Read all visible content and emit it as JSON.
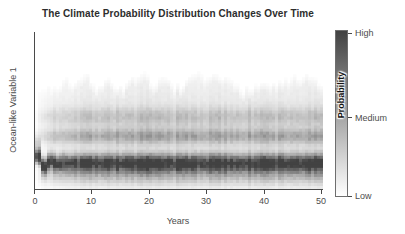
{
  "title": "The Climate Probability Distribution Changes Over Time",
  "axes": {
    "x_label": "Years",
    "y_label": "Ocean-like Variable 1",
    "x_tick_labels": [
      "0",
      "10",
      "20",
      "30",
      "40",
      "50"
    ]
  },
  "colorbar": {
    "label": "Probability",
    "ticks": [
      "High",
      "Medium",
      "Low"
    ]
  },
  "colors": {
    "background": "#ffffff",
    "title_text": "#2d2d2d",
    "label_text": "#4d4d4d",
    "spine": "#4a4a4a",
    "colorbar_border": "#6e6e6e"
  },
  "chart_data": {
    "type": "heatmap",
    "title": "The Climate Probability Distribution Changes Over Time",
    "xlabel": "Years",
    "ylabel": "Ocean-like Variable 1",
    "x_range": [
      0,
      50
    ],
    "x_ticks": [
      0,
      10,
      20,
      30,
      40,
      50
    ],
    "y_range_normalized": [
      0,
      1
    ],
    "y_ticks": [],
    "grid": false,
    "legend": "none",
    "colormap": {
      "low": "#ffffff",
      "high": "#424242"
    },
    "colorbar": {
      "label": "Probability",
      "position": "right",
      "tick_labels": [
        {
          "pos": 1.0,
          "label": "High"
        },
        {
          "pos": 0.5,
          "label": "Medium"
        },
        {
          "pos": 0.0,
          "label": "Low"
        }
      ]
    },
    "distribution": {
      "summary": "Probability density of an ocean-like variable over 50 years: starts as one concentrated dark mode near the lower part of the axis, wobbles briefly, then spreads within ~8 years into a stationary multimodal distribution with a persistent dark primary band, two fainter bands above it, and a very light irregular haze extending toward the top.",
      "spread_timescale_years": 3,
      "transient": {
        "decay_years": 1.6,
        "wobble_amplitude": 0.07,
        "wobble_frequency": 2.8,
        "patch_intensity": 0.4,
        "patch_sigma": 0.05,
        "patch_offset_factor": 2.4
      },
      "bands": [
        {
          "name": "primary-mode",
          "center": 0.165,
          "sigma_start": 0.026,
          "sigma_end": 0.04,
          "intensity": 0.95,
          "grows_with_spread": false
        },
        {
          "name": "lower-shoulder",
          "center": 0.085,
          "sigma_start": 0.03,
          "sigma_end": 0.045,
          "intensity": 0.28,
          "grows_with_spread": true
        },
        {
          "name": "secondary-band",
          "center": 0.335,
          "sigma_start": 0.028,
          "sigma_end": 0.034,
          "intensity": 0.36,
          "grows_with_spread": true
        },
        {
          "name": "tertiary-band",
          "center": 0.46,
          "sigma_start": 0.032,
          "sigma_end": 0.04,
          "intensity": 0.21,
          "grows_with_spread": true
        },
        {
          "name": "upper-haze",
          "center": 0.43,
          "sigma_start": 0.18,
          "sigma_end": 0.27,
          "intensity": 0.13,
          "grows_with_spread": true,
          "skyline_cut": true
        }
      ],
      "skyline": {
        "base": 0.66,
        "variation": 0.22
      },
      "column_noise": 0.35,
      "cell_noise": 0.22,
      "grid_size": {
        "cols": 96,
        "rows": 52
      }
    }
  }
}
